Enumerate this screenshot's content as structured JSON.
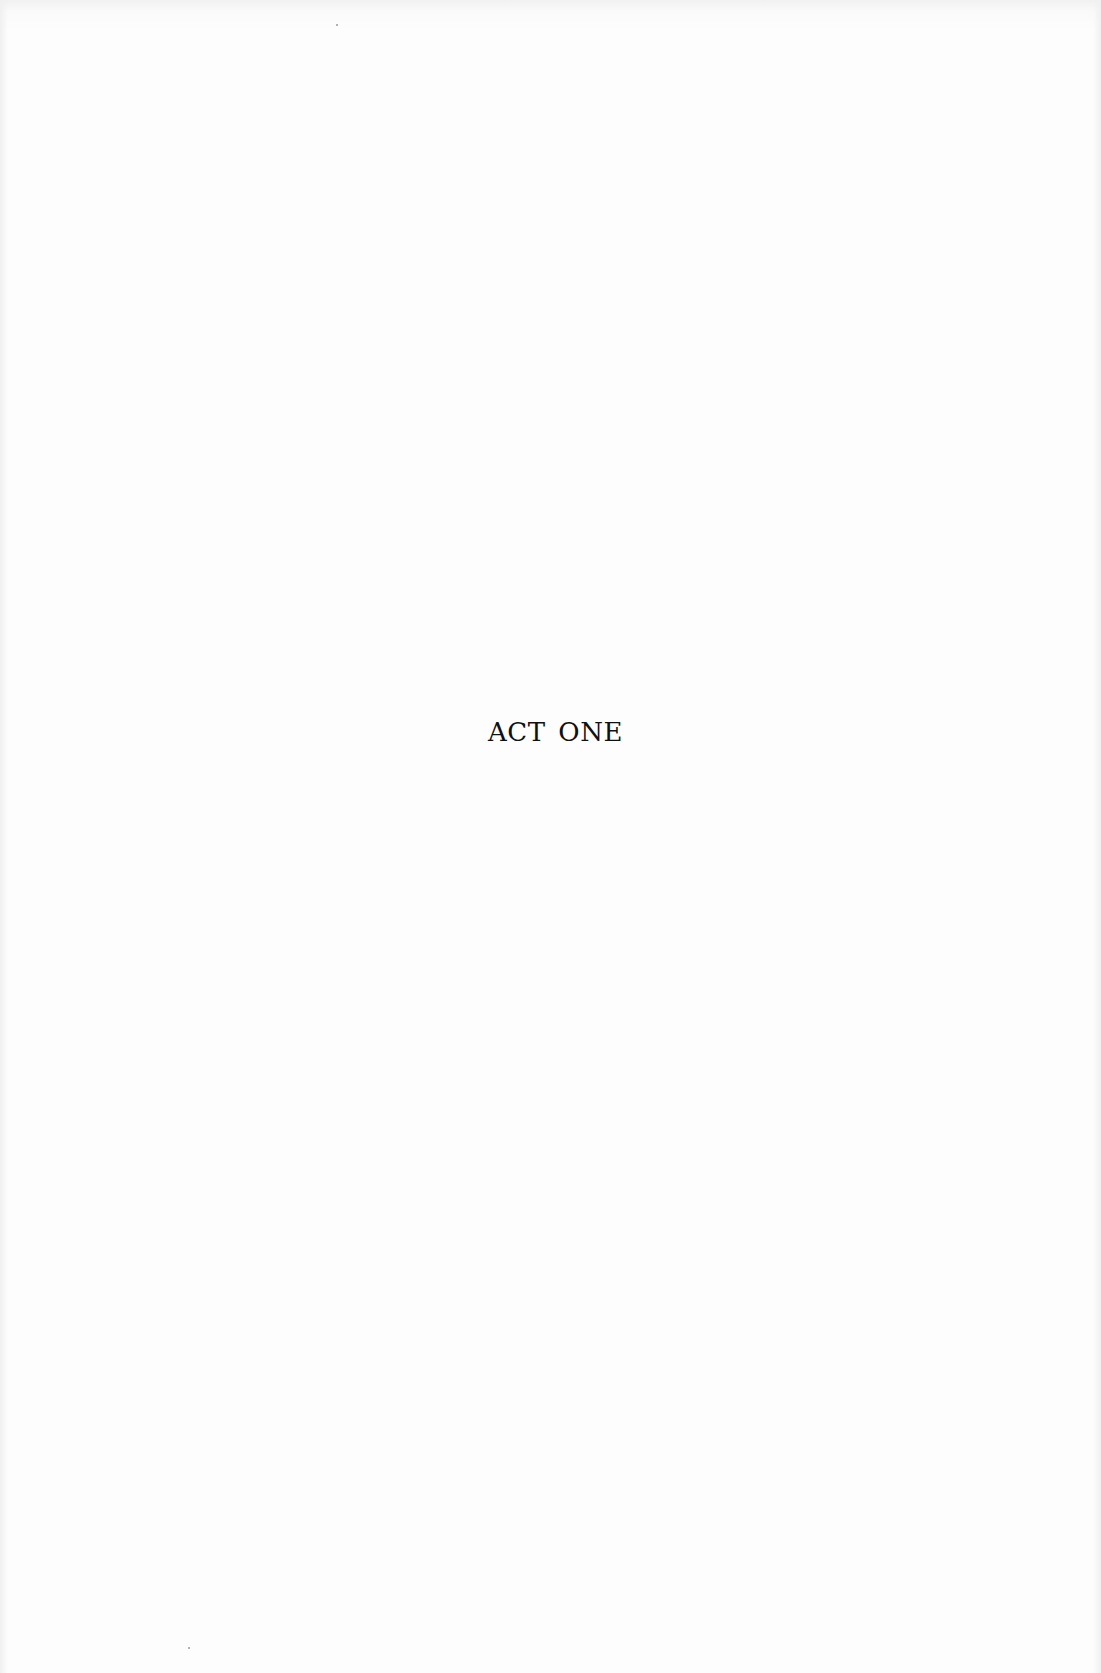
{
  "page": {
    "heading": "ACT ONE"
  },
  "colors": {
    "paper": "#fdfdfd",
    "ink": "#111111"
  }
}
